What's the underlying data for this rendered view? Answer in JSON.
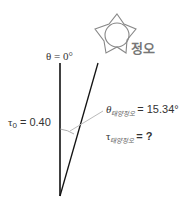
{
  "diagram": {
    "zenith_label": "θ = 0°",
    "sun_label": "정오",
    "tau0_label": "τ",
    "tau0_subscript": "0",
    "tau0_value": " = 0.40",
    "theta_symbol": "θ",
    "theta_subscript": "태양정오",
    "theta_value": " = 15.34°",
    "tau_symbol": "τ",
    "tau_subscript": "태양정오",
    "tau_value": " =  ?",
    "colors": {
      "line": "#111111",
      "sun": "#888888",
      "leader": "#bbbbbb",
      "text": "#333333"
    }
  }
}
